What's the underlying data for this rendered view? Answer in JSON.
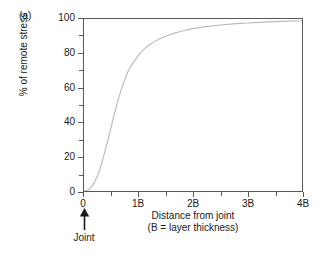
{
  "panel": {
    "letter": "(a)"
  },
  "annotations": {
    "joint_label": "Joint",
    "joint_arrow_icon": "up-arrow-icon"
  },
  "colors": {
    "axis": "#55585c",
    "curve": "#b9b9b9",
    "text": "#1a1a1a",
    "background": "#ffffff"
  },
  "chart_data": {
    "type": "line",
    "title": "",
    "subtitle": "",
    "xlabel": "Distance from joint",
    "xlabel_line2": "(B = layer thickness)",
    "ylabel": "% of remote stress",
    "xlim": [
      0,
      4
    ],
    "ylim": [
      0,
      100
    ],
    "grid": false,
    "legend": false,
    "legend_position": "none",
    "x_tick_labels": [
      "0",
      "1B",
      "2B",
      "3B",
      "4B"
    ],
    "x_tick_values": [
      0,
      1,
      2,
      3,
      4
    ],
    "x_minor_tick_values": [
      0.5,
      1.5,
      2.5,
      3.5
    ],
    "y_tick_labels": [
      "0",
      "20",
      "40",
      "60",
      "80",
      "100"
    ],
    "y_tick_values": [
      0,
      20,
      40,
      60,
      80,
      100
    ],
    "y_minor_tick_values": [
      10,
      30,
      50,
      70,
      90
    ],
    "series": [
      {
        "name": "stress recovery",
        "color": "#b9b9b9",
        "x": [
          0,
          0.05,
          0.1,
          0.15,
          0.2,
          0.25,
          0.3,
          0.35,
          0.4,
          0.45,
          0.5,
          0.55,
          0.6,
          0.65,
          0.7,
          0.75,
          0.8,
          0.85,
          0.9,
          1.0,
          1.1,
          1.2,
          1.3,
          1.4,
          1.5,
          1.6,
          1.8,
          2.0,
          2.2,
          2.5,
          2.8,
          3.0,
          3.3,
          3.6,
          4.0
        ],
        "values": [
          0,
          0.3,
          1.2,
          3,
          5.5,
          9,
          13.5,
          19,
          25,
          31,
          37.5,
          44,
          50,
          55.5,
          60.5,
          65,
          69,
          72,
          74.5,
          79,
          82.5,
          85,
          87,
          88.7,
          90,
          91.2,
          93,
          94.4,
          95.4,
          96.5,
          97.3,
          97.7,
          98.2,
          98.6,
          99
        ]
      }
    ]
  }
}
